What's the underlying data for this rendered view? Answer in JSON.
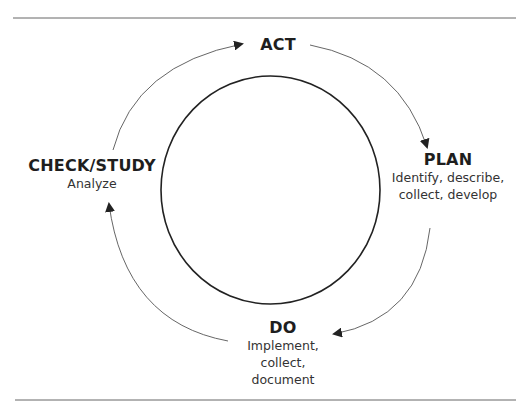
{
  "diagram": {
    "type": "cycle",
    "name": "PDCA / PDSA cycle",
    "stages": [
      {
        "id": "act",
        "title": "ACT",
        "description": []
      },
      {
        "id": "plan",
        "title": "PLAN",
        "description": [
          "Identify, describe,",
          "collect, develop"
        ]
      },
      {
        "id": "do",
        "title": "DO",
        "description": [
          "Implement,",
          "collect,",
          "document"
        ]
      },
      {
        "id": "check",
        "title": "CHECK/STUDY",
        "description": [
          "Analyze"
        ]
      }
    ],
    "flow": [
      "ACT",
      "PLAN",
      "DO",
      "CHECK/STUDY",
      "ACT"
    ],
    "direction": "clockwise",
    "colors": {
      "stroke": "#222222",
      "arrow": "#555555",
      "text": "#222222",
      "background": "#ffffff"
    }
  }
}
